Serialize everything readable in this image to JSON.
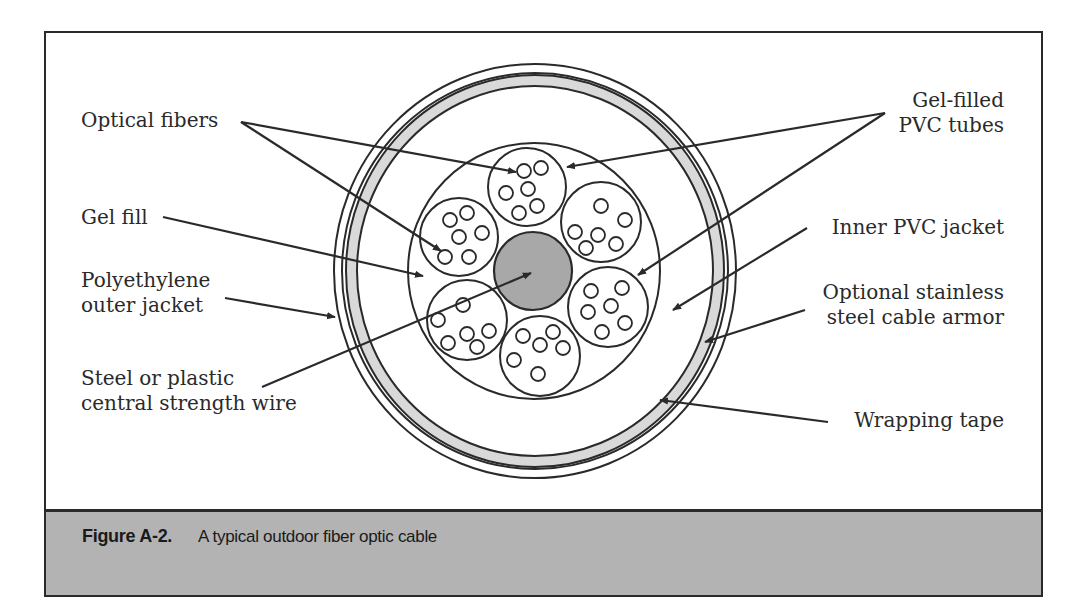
{
  "figure": {
    "number": "Figure A-2.",
    "caption": "A typical outdoor fiber optic cable"
  },
  "colors": {
    "line": "#2a2a2a",
    "wrapping_tape_fill": "#d9d9d9",
    "central_core_fill": "#a8a8a8",
    "caption_band": "#b3b3b3",
    "background": "#ffffff"
  },
  "labels": {
    "optical_fibers": "Optical fibers",
    "gel_fill": "Gel fill",
    "polyethylene_line1": "Polyethylene",
    "polyethylene_line2": "outer jacket",
    "steel_line1": "Steel or plastic",
    "steel_line2": "central strength wire",
    "gel_filled_line1": "Gel-filled",
    "gel_filled_line2": "PVC tubes",
    "inner_pvc": "Inner PVC jacket",
    "armor_line1": "Optional stainless",
    "armor_line2": "steel cable armor",
    "wrapping_tape": "Wrapping tape"
  },
  "cable_structure": {
    "center": [
      535,
      271
    ],
    "layers_outside_in": [
      "Polyethylene outer jacket",
      "Optional stainless steel cable armor",
      "Wrapping tape",
      "Gel fill",
      "Inner PVC jacket",
      "Gel-filled PVC tubes (6)",
      "Optical fibers (6 per tube)",
      "Steel or plastic central strength wire"
    ],
    "tube_count": 6,
    "fibers_per_tube": 6
  }
}
